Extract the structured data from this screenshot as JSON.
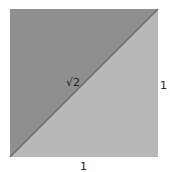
{
  "diagram": {
    "square": {
      "x": 10,
      "y": 9,
      "size": 148
    },
    "colors": {
      "upper_triangle": "#8f8f8f",
      "lower_triangle": "#b7b7b7",
      "diagonal": "#6a6a6a",
      "text": "#222222"
    },
    "labels": {
      "diagonal": "√2",
      "right_side": "1",
      "bottom_side": "1"
    }
  }
}
